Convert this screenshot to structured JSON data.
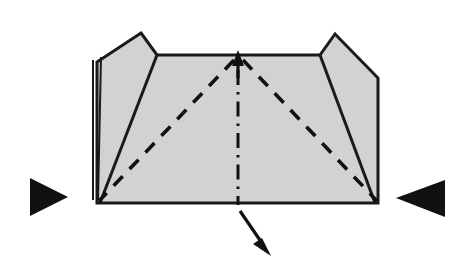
{
  "figure": {
    "kind": "origami-fold-diagram",
    "background_color": "#ffffff",
    "paper_fill_color": "#d2d2d2",
    "line_color": "#111111",
    "canvas": {
      "width": 470,
      "height": 276
    }
  },
  "shapes": {
    "center_panel": {
      "name": "center-trapezoid-panel",
      "points": "158,55 320,55 378,203 97,203"
    },
    "left_flap": {
      "name": "left-flap-panel",
      "points": "141,33 157,55 100,203 97,203 97,62"
    },
    "right_flap": {
      "name": "right-flap-panel",
      "points": "335,34 378,78 378,203 375,203 320,55"
    },
    "outline": {
      "name": "paper-outline",
      "points": "141,33 157,55 320,55 335,34 378,78 378,203 97,203 97,62"
    },
    "left_edge_detail": {
      "name": "left-edge-layer-line",
      "d": "M 93,60 L 93,200 M 101,57 L 98,200"
    }
  },
  "creases": {
    "left_flap_crease": {
      "name": "left-flap-crease",
      "d": "M 157,55 L 100,203"
    },
    "right_flap_crease": {
      "name": "right-flap-crease",
      "d": "M 320,55 L 375,203"
    },
    "valley_left": {
      "name": "valley-fold-left",
      "d": "M 234,60 L 99,201"
    },
    "valley_right": {
      "name": "valley-fold-right",
      "d": "M 243,60 L 377,201"
    }
  },
  "axis": {
    "center_line": {
      "name": "center-axis-dash-dot-line",
      "d": "M 238,70 L 238,205"
    },
    "up_arrow_shaft": {
      "name": "up-arrow-shaft",
      "d": "M 238,58 L 238,78"
    },
    "up_arrow_head": {
      "name": "up-arrow-head",
      "points": "238,50 232,66 244,66"
    }
  },
  "markers": {
    "left_pressure_marker": {
      "name": "left-push-triangle-marker",
      "direction": "points-right",
      "points": "30,178 68,197 30,216"
    },
    "right_pressure_marker": {
      "name": "right-push-triangle-marker",
      "direction": "points-left",
      "points": "445,180 445,217 396,198"
    },
    "pull_arrow": {
      "name": "pull-down-right-arrow",
      "shaft_d": "M 240,211 L 264,246",
      "head_points": "271,256 253,244 262,238"
    }
  }
}
